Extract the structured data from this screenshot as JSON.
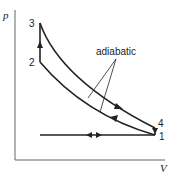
{
  "diagram": {
    "type": "p-V cycle diagram",
    "axes": {
      "y_label": "p",
      "x_label": "V"
    },
    "points": [
      {
        "id": "1",
        "label": "1"
      },
      {
        "id": "2",
        "label": "2"
      },
      {
        "id": "3",
        "label": "3"
      },
      {
        "id": "4",
        "label": "4"
      }
    ],
    "annotation": "adiabatic",
    "colors": {
      "line": "#222222",
      "axis": "#555555",
      "background": "#ffffff"
    }
  }
}
